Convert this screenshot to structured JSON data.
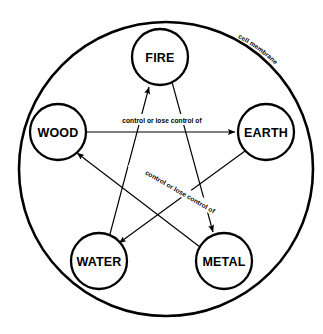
{
  "diagram": {
    "membrane": {
      "label": "cell membrane",
      "stroke_color": "#000000",
      "fill_color": "#ffffff"
    },
    "nodes": [
      {
        "id": "fire",
        "label": "FIRE",
        "cx": 160,
        "cy": 57,
        "r": 28
      },
      {
        "id": "wood",
        "label": "WOOD",
        "cx": 58,
        "cy": 132,
        "r": 28
      },
      {
        "id": "earth",
        "label": "EARTH",
        "cx": 266,
        "cy": 132,
        "r": 28
      },
      {
        "id": "water",
        "label": "WATER",
        "cx": 99,
        "cy": 261,
        "r": 28
      },
      {
        "id": "metal",
        "label": "METAL",
        "cx": 224,
        "cy": 261,
        "r": 28
      }
    ],
    "edges": [
      {
        "id": "wood-earth",
        "from": "wood",
        "to": "earth",
        "label": "control or lose control of",
        "label_rotation": 0
      },
      {
        "id": "earth-water",
        "from": "earth",
        "to": "water",
        "label": "control or lose control of",
        "label_rotation": 30
      },
      {
        "id": "water-fire",
        "from": "water",
        "to": "fire",
        "label": "",
        "label_rotation": 0
      },
      {
        "id": "fire-metal",
        "from": "fire",
        "to": "metal",
        "label": "",
        "label_rotation": 0
      },
      {
        "id": "metal-wood",
        "from": "metal",
        "to": "wood",
        "label": "",
        "label_rotation": 0
      }
    ],
    "colors": {
      "stroke": "#000000",
      "background": "#ffffff",
      "text": "#000000"
    }
  }
}
